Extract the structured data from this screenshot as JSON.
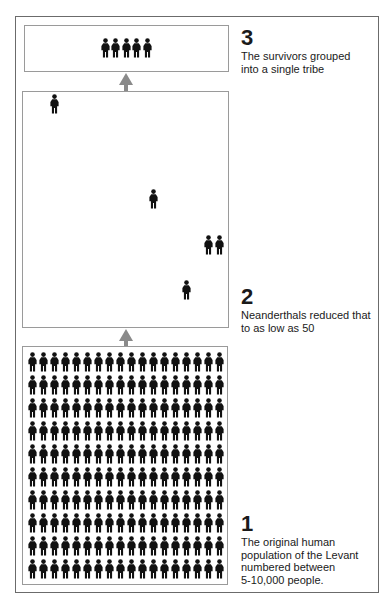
{
  "colors": {
    "figure": "#111111",
    "arrow": "#8a8a8a",
    "stage_border": "#9a9a9a",
    "outer_border": "#6b6b6b"
  },
  "stages": [
    {
      "id": "stage-3",
      "number": "3",
      "text_lines": [
        "The survivors grouped",
        "into a single tribe"
      ],
      "figure_count": 5,
      "layout": "row"
    },
    {
      "id": "stage-2",
      "number": "2",
      "text_lines": [
        "Neanderthals reduced that",
        "to as low as 50"
      ],
      "figure_count": 5,
      "layout": "scattered",
      "figure_positions": [
        [
          54,
          104
        ],
        [
          153,
          199
        ],
        [
          208,
          245
        ],
        [
          219,
          245
        ],
        [
          186,
          290
        ]
      ]
    },
    {
      "id": "stage-1",
      "number": "1",
      "text_lines": [
        "The original human",
        "population of the Levant",
        "numbered between",
        "5-10,000 people."
      ],
      "figure_count": 180,
      "layout": "grid",
      "grid": {
        "rows": 10,
        "columns": 18
      }
    }
  ],
  "icons": {
    "figure": "person-icon",
    "arrow": "arrow-up-icon"
  }
}
